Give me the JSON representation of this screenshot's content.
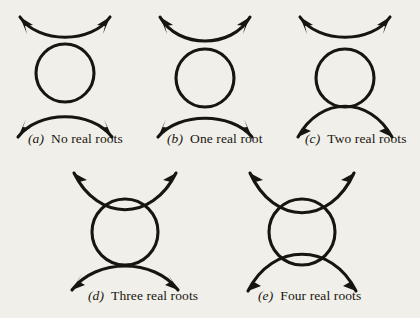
{
  "figure": {
    "background_color": "#f1efe9",
    "ink_color": "#17150f",
    "stroke_width": 3.1
  },
  "panels": [
    {
      "id": "a",
      "tag": "(a)",
      "caption": "No real roots",
      "intersection_count": 0,
      "upper_arc": "opens-up, entirely above circle, no contact",
      "lower_arc": "opens-down, entirely below circle, no contact",
      "circle": {
        "cx": 65,
        "cy": 73,
        "r": 29
      }
    },
    {
      "id": "b",
      "tag": "(b)",
      "caption": "One real root",
      "intersection_count": 1,
      "upper_arc": "opens-up, tangent to top of circle",
      "lower_arc": "opens-down, entirely below circle, no contact",
      "circle": {
        "cx": 65,
        "cy": 78,
        "r": 29
      }
    },
    {
      "id": "c",
      "tag": "(c)",
      "caption": "Two real roots",
      "intersection_count": 2,
      "upper_arc": "opens-up, entirely above circle, no contact",
      "lower_arc": "opens-down, crosses circle at two points near bottom",
      "circle": {
        "cx": 65,
        "cy": 78,
        "r": 29
      }
    },
    {
      "id": "d",
      "tag": "(d)",
      "caption": "Three real roots",
      "intersection_count": 3,
      "upper_arc": "opens-up, crosses circle at two points near top",
      "lower_arc": "opens-down, tangent to bottom of circle",
      "circle": {
        "cx": 65,
        "cy": 72,
        "r": 33
      }
    },
    {
      "id": "e",
      "tag": "(e)",
      "caption": "Four real roots",
      "intersection_count": 4,
      "upper_arc": "opens-up, crosses circle at two points near top",
      "lower_arc": "opens-down, crosses circle at two points near bottom",
      "circle": {
        "cx": 72,
        "cy": 72,
        "r": 33
      }
    }
  ]
}
